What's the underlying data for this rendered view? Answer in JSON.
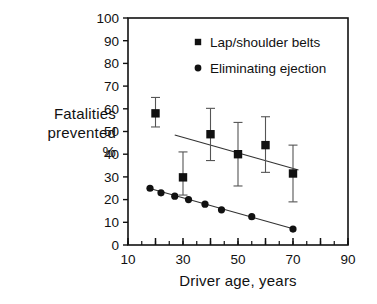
{
  "chart_data": {
    "type": "scatter",
    "title": "",
    "xlabel": "Driver age, years",
    "ylabel": "Fatalities prevented %",
    "ylabel_lines": [
      "Fatalities",
      "prevented",
      "%"
    ],
    "xlim": [
      10,
      90
    ],
    "ylim": [
      0,
      100
    ],
    "xticks": [
      10,
      20,
      30,
      40,
      50,
      60,
      70,
      80,
      90
    ],
    "xtick_labels": [
      "10",
      "",
      "30",
      "",
      "50",
      "",
      "70",
      "",
      "90"
    ],
    "yticks": [
      0,
      10,
      20,
      30,
      40,
      50,
      60,
      70,
      80,
      90,
      100
    ],
    "ytick_labels": [
      "0",
      "10",
      "20",
      "30",
      "40",
      "50",
      "60",
      "70",
      "80",
      "90",
      "100"
    ],
    "x_minor_tick_step": 5,
    "grid": false,
    "legend_position": "top-right-inside",
    "series": [
      {
        "name": "Lap/shoulder belts",
        "marker": "square",
        "color": "#111111",
        "has_error_bars": true,
        "points": [
          {
            "x": 20,
            "y": 58.0,
            "low": 52.0,
            "high": 65.0
          },
          {
            "x": 30,
            "y": 29.8,
            "low": 22.0,
            "high": 41.0
          },
          {
            "x": 40,
            "y": 48.8,
            "low": 37.2,
            "high": 60.2
          },
          {
            "x": 50,
            "y": 40.0,
            "low": 26.0,
            "high": 54.0
          },
          {
            "x": 60,
            "y": 44.0,
            "low": 32.0,
            "high": 56.5
          },
          {
            "x": 70,
            "y": 31.5,
            "low": 19.0,
            "high": 44.0
          }
        ],
        "trend_line": {
          "x1": 27,
          "y1": 48.5,
          "x2": 72,
          "y2": 33.0
        }
      },
      {
        "name": "Eliminating ejection",
        "marker": "circle",
        "color": "#111111",
        "has_error_bars": false,
        "points": [
          {
            "x": 18,
            "y": 25.0
          },
          {
            "x": 22,
            "y": 23.0
          },
          {
            "x": 27,
            "y": 21.5
          },
          {
            "x": 32,
            "y": 20.0
          },
          {
            "x": 38,
            "y": 18.0
          },
          {
            "x": 44,
            "y": 15.5
          },
          {
            "x": 55,
            "y": 12.5
          },
          {
            "x": 70,
            "y": 7.0
          }
        ],
        "trend_line": {
          "x1": 17,
          "y1": 25.2,
          "x2": 71,
          "y2": 6.8
        }
      }
    ]
  },
  "legend": {
    "items": [
      {
        "label": "Lap/shoulder belts",
        "marker": "square"
      },
      {
        "label": "Eliminating ejection",
        "marker": "circle"
      }
    ]
  },
  "colors": {
    "axis": "#111111",
    "marker": "#111111",
    "errorbar": "#555555",
    "trend": "#333333",
    "background": "#ffffff"
  }
}
